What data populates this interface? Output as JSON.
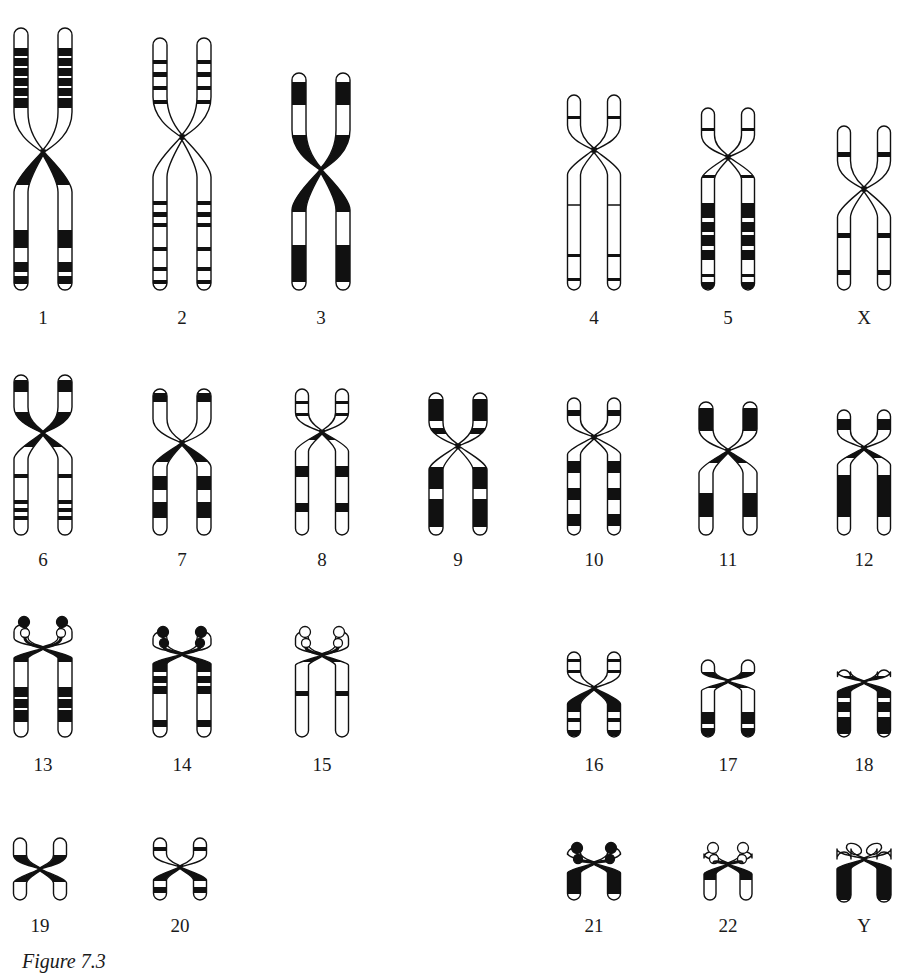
{
  "figure": {
    "caption": "Figure 7.3",
    "ink_color": "#111111",
    "paper_color": "#ffffff"
  },
  "chromosomes": [
    {
      "id": "1",
      "label": "1",
      "cx": 43,
      "top": 28,
      "cent": 152,
      "bottom": 290,
      "w": 14,
      "gap": 22,
      "labelY": 308,
      "p": [
        [
          48,
          56,
          "b"
        ],
        [
          58,
          66,
          "b"
        ],
        [
          68,
          76,
          "b"
        ],
        [
          78,
          86,
          "b"
        ],
        [
          88,
          96,
          "b"
        ],
        [
          98,
          108,
          "b"
        ]
      ],
      "q": [
        [
          152,
          185,
          "b"
        ],
        [
          230,
          248,
          "b"
        ],
        [
          262,
          272,
          "b"
        ],
        [
          276,
          284,
          "b"
        ]
      ]
    },
    {
      "id": "2",
      "label": "2",
      "cx": 182,
      "top": 38,
      "cent": 137,
      "bottom": 290,
      "w": 14,
      "gap": 22,
      "labelY": 308,
      "p": [
        [
          60,
          64,
          "b"
        ],
        [
          72,
          77,
          "b"
        ],
        [
          86,
          90,
          "b"
        ],
        [
          100,
          104,
          "b"
        ]
      ],
      "q": [
        [
          201,
          205,
          "b"
        ],
        [
          212,
          217,
          "b"
        ],
        [
          223,
          227,
          "b"
        ],
        [
          247,
          251,
          "b"
        ],
        [
          267,
          271,
          "b"
        ],
        [
          280,
          284,
          "b"
        ]
      ]
    },
    {
      "id": "3",
      "label": "3",
      "cx": 321,
      "top": 73,
      "cent": 170,
      "bottom": 290,
      "w": 14,
      "gap": 22,
      "labelY": 308,
      "p": [
        [
          82,
          105,
          "b"
        ],
        [
          135,
          170,
          "b"
        ]
      ],
      "q": [
        [
          170,
          212,
          "b"
        ],
        [
          245,
          282,
          "b"
        ]
      ]
    },
    {
      "id": "4",
      "label": "4",
      "cx": 594,
      "top": 95,
      "cent": 150,
      "bottom": 290,
      "w": 13,
      "gap": 20,
      "labelY": 308,
      "p": [
        [
          116,
          119,
          "b"
        ]
      ],
      "q": [
        [
          205,
          207,
          "l"
        ],
        [
          254,
          257,
          "b"
        ],
        [
          278,
          281,
          "b"
        ]
      ]
    },
    {
      "id": "5",
      "label": "5",
      "cx": 728,
      "top": 108,
      "cent": 157,
      "bottom": 290,
      "w": 13,
      "gap": 20,
      "labelY": 308,
      "p": [
        [
          128,
          131,
          "b"
        ]
      ],
      "q": [
        [
          175,
          178,
          "b"
        ],
        [
          203,
          218,
          "b"
        ],
        [
          222,
          232,
          "b"
        ],
        [
          235,
          246,
          "b"
        ],
        [
          250,
          260,
          "b"
        ],
        [
          274,
          277,
          "b"
        ],
        [
          282,
          289,
          "b"
        ]
      ]
    },
    {
      "id": "X",
      "label": "X",
      "cx": 864,
      "top": 126,
      "cent": 189,
      "bottom": 290,
      "w": 13,
      "gap": 20,
      "labelY": 308,
      "p": [
        [
          152,
          157,
          "b"
        ]
      ],
      "q": [
        [
          233,
          238,
          "b"
        ],
        [
          270,
          275,
          "b"
        ]
      ]
    },
    {
      "id": "6",
      "label": "6",
      "cx": 43,
      "top": 375,
      "cent": 433,
      "bottom": 535,
      "w": 14,
      "gap": 22,
      "labelY": 550,
      "p": [
        [
          380,
          392,
          "b"
        ],
        [
          412,
          433,
          "b"
        ]
      ],
      "q": [
        [
          433,
          447,
          "b"
        ],
        [
          474,
          478,
          "b"
        ],
        [
          500,
          504,
          "b"
        ],
        [
          508,
          512,
          "b"
        ],
        [
          516,
          520,
          "b"
        ]
      ]
    },
    {
      "id": "7",
      "label": "7",
      "cx": 182,
      "top": 389,
      "cent": 443,
      "bottom": 535,
      "w": 14,
      "gap": 22,
      "labelY": 550,
      "p": [
        [
          393,
          402,
          "b"
        ]
      ],
      "q": [
        [
          443,
          462,
          "b"
        ],
        [
          476,
          490,
          "b"
        ],
        [
          502,
          518,
          "b"
        ]
      ]
    },
    {
      "id": "8",
      "label": "8",
      "cx": 322,
      "top": 389,
      "cent": 432,
      "bottom": 535,
      "w": 13,
      "gap": 20,
      "labelY": 550,
      "p": [
        [
          401,
          404,
          "b"
        ],
        [
          413,
          416,
          "b"
        ]
      ],
      "q": [
        [
          432,
          440,
          "b"
        ],
        [
          466,
          477,
          "b"
        ],
        [
          503,
          512,
          "b"
        ]
      ]
    },
    {
      "id": "9",
      "label": "9",
      "cx": 458,
      "top": 393,
      "cent": 446,
      "bottom": 535,
      "w": 14,
      "gap": 22,
      "labelY": 550,
      "p": [
        [
          399,
          421,
          "b"
        ],
        [
          428,
          434,
          "b"
        ]
      ],
      "q": [
        [
          467,
          489,
          "b"
        ],
        [
          499,
          527,
          "b"
        ]
      ]
    },
    {
      "id": "10",
      "label": "10",
      "cx": 594,
      "top": 398,
      "cent": 437,
      "bottom": 535,
      "w": 13,
      "gap": 20,
      "labelY": 550,
      "p": [
        [
          410,
          416,
          "b"
        ]
      ],
      "q": [
        [
          461,
          473,
          "b"
        ],
        [
          488,
          500,
          "b"
        ],
        [
          514,
          526,
          "b"
        ]
      ]
    },
    {
      "id": "11",
      "label": "11",
      "cx": 728,
      "top": 402,
      "cent": 451,
      "bottom": 535,
      "w": 14,
      "gap": 22,
      "labelY": 550,
      "p": [
        [
          408,
          431,
          "b"
        ]
      ],
      "q": [
        [
          451,
          463,
          "b"
        ],
        [
          493,
          517,
          "b"
        ]
      ]
    },
    {
      "id": "12",
      "label": "12",
      "cx": 864,
      "top": 410,
      "cent": 448,
      "bottom": 535,
      "w": 13,
      "gap": 20,
      "labelY": 550,
      "p": [
        [
          419,
          430,
          "b"
        ]
      ],
      "q": [
        [
          448,
          458,
          "b"
        ],
        [
          475,
          517,
          "b"
        ]
      ]
    },
    {
      "id": "13",
      "label": "13",
      "cx": 43,
      "top": 625,
      "cent": 648,
      "bottom": 737,
      "w": 14,
      "gap": 22,
      "labelY": 755,
      "sat": {
        "color": "b",
        "y": 622,
        "stalk": "o"
      },
      "p": [],
      "q": [
        [
          648,
          662,
          "b"
        ],
        [
          687,
          697,
          "b"
        ],
        [
          699,
          708,
          "b"
        ],
        [
          710,
          722,
          "b"
        ]
      ]
    },
    {
      "id": "14",
      "label": "14",
      "cx": 182,
      "top": 632,
      "cent": 654,
      "bottom": 737,
      "w": 14,
      "gap": 22,
      "labelY": 755,
      "sat": {
        "color": "b",
        "y": 632,
        "stalk": "b"
      },
      "p": [],
      "q": [
        [
          654,
          672,
          "b"
        ],
        [
          676,
          683,
          "b"
        ],
        [
          686,
          694,
          "b"
        ],
        [
          720,
          727,
          "b"
        ]
      ]
    },
    {
      "id": "15",
      "label": "15",
      "cx": 322,
      "top": 632,
      "cent": 655,
      "bottom": 737,
      "w": 13,
      "gap": 20,
      "labelY": 755,
      "sat": {
        "color": "o",
        "y": 632,
        "stalk": "o"
      },
      "p": [],
      "q": [
        [
          655,
          662,
          "b"
        ],
        [
          691,
          696,
          "b"
        ]
      ]
    },
    {
      "id": "16",
      "label": "16",
      "cx": 594,
      "top": 652,
      "cent": 688,
      "bottom": 737,
      "w": 13,
      "gap": 20,
      "labelY": 755,
      "p": [
        [
          659,
          662,
          "b"
        ],
        [
          670,
          673,
          "b"
        ]
      ],
      "q": [
        [
          688,
          712,
          "b"
        ],
        [
          718,
          722,
          "b"
        ],
        [
          730,
          736,
          "b"
        ]
      ]
    },
    {
      "id": "17",
      "label": "17",
      "cx": 728,
      "top": 660,
      "cent": 681,
      "bottom": 737,
      "w": 13,
      "gap": 20,
      "labelY": 755,
      "p": [
        [
          672,
          680,
          "b"
        ]
      ],
      "q": [
        [
          681,
          688,
          "b"
        ],
        [
          712,
          724,
          "b"
        ],
        [
          728,
          736,
          "b"
        ]
      ]
    },
    {
      "id": "18",
      "label": "18",
      "cx": 864,
      "top": 670,
      "cent": 682,
      "bottom": 737,
      "w": 13,
      "gap": 20,
      "labelY": 755,
      "p": [
        [
          676,
          682,
          "b"
        ]
      ],
      "q": [
        [
          682,
          698,
          "b"
        ],
        [
          702,
          712,
          "b"
        ],
        [
          717,
          734,
          "b"
        ]
      ]
    },
    {
      "id": "19",
      "label": "19",
      "cx": 40,
      "top": 838,
      "cent": 869,
      "bottom": 900,
      "w": 13,
      "gap": 20,
      "labelY": 916,
      "p": [
        [
          855,
          869,
          "b"
        ]
      ],
      "q": [
        [
          869,
          882,
          "b"
        ]
      ]
    },
    {
      "id": "20",
      "label": "20",
      "cx": 180,
      "top": 838,
      "cent": 867,
      "bottom": 900,
      "w": 13,
      "gap": 20,
      "labelY": 916,
      "p": [
        [
          847,
          851,
          "b"
        ]
      ],
      "q": [
        [
          867,
          881,
          "b"
        ],
        [
          887,
          893,
          "b"
        ]
      ]
    },
    {
      "id": "21",
      "label": "21",
      "cx": 594,
      "top": 848,
      "cent": 863,
      "bottom": 900,
      "w": 13,
      "gap": 20,
      "labelY": 916,
      "sat": {
        "color": "b",
        "y": 848,
        "stalk": "b"
      },
      "p": [],
      "q": [
        [
          863,
          894,
          "b"
        ]
      ]
    },
    {
      "id": "22",
      "label": "22",
      "cx": 728,
      "top": 852,
      "cent": 864,
      "bottom": 900,
      "w": 12,
      "gap": 18,
      "labelY": 916,
      "sat": {
        "color": "o",
        "y": 848,
        "stalk": "o"
      },
      "p": [],
      "q": [
        [
          864,
          880,
          "b"
        ]
      ]
    },
    {
      "id": "Y",
      "label": "Y",
      "cx": 864,
      "top": 852,
      "cent": 859,
      "bottom": 902,
      "w": 14,
      "gap": 20,
      "labelY": 916,
      "yloop": true,
      "p": [],
      "q": [
        [
          859,
          900,
          "b"
        ]
      ]
    }
  ]
}
